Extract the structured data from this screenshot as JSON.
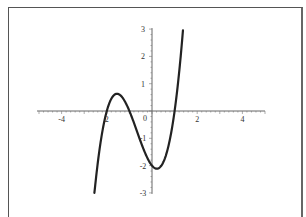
{
  "chart_data": {
    "type": "line",
    "title": "",
    "xlabel": "",
    "ylabel": "",
    "function": "y = x^3 + 2x^2 - x - 2",
    "xlim": [
      -5,
      5
    ],
    "ylim": [
      -3,
      3
    ],
    "x_ticks": [
      "-4",
      "2",
      "2",
      "4"
    ],
    "x_tick_values": [
      -4,
      -2,
      2,
      4
    ],
    "x_tick_labels_display": {
      "-4": "-4",
      "-2": "2",
      "0": "0",
      "2": "2",
      "4": "4"
    },
    "y_ticks": [
      "3",
      "2",
      "1",
      "-1",
      "-2",
      "-3"
    ],
    "y_tick_values": [
      3,
      2,
      1,
      -1,
      -2,
      -3
    ],
    "origin_label": "0",
    "grid": false,
    "legend": null,
    "series": [
      {
        "name": "cubic",
        "color": "#222222",
        "x": [
          -2.55,
          -2.4,
          -2.2,
          -2.0,
          -1.8,
          -1.55,
          -1.3,
          -1.0,
          -0.7,
          -0.4,
          -0.2,
          0.0,
          0.22,
          0.5,
          0.8,
          1.0,
          1.2,
          1.37
        ],
        "y": [
          -3.0,
          -1.82,
          -0.77,
          0.0,
          0.5,
          0.63,
          0.46,
          0.0,
          -0.6,
          -1.34,
          -1.73,
          -2.0,
          -2.11,
          -1.88,
          -1.17,
          0.0,
          1.06,
          3.0
        ]
      }
    ],
    "key_points": {
      "roots": [
        -2,
        -1,
        1
      ],
      "y_intercept": -2,
      "local_max": [
        -1.55,
        0.63
      ],
      "local_min": [
        0.22,
        -2.11
      ]
    }
  }
}
